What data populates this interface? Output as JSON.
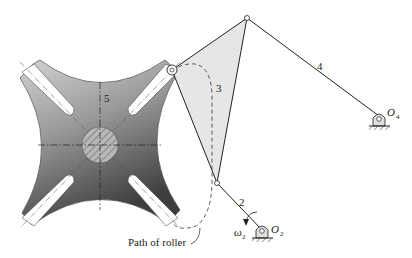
{
  "diagram": {
    "type": "mechanism",
    "labels": {
      "link2": "2",
      "link3": "3",
      "link4": "4",
      "link5": "5",
      "pivot_o2": "O",
      "pivot_o2_sub": "2",
      "pivot_o4": "O",
      "pivot_o4_sub": "4",
      "omega": "ω",
      "omega_sub": "2",
      "path_label": "Path of roller"
    },
    "colors": {
      "wheel_light": "#c8c8c8",
      "wheel_dark": "#4a4a4a",
      "coupler_fill": "#e4e4e4",
      "line": "#222222"
    }
  }
}
